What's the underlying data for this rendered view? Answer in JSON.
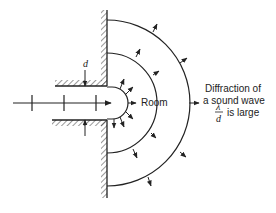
{
  "diagram": {
    "labels": {
      "d": "d",
      "room": "Room",
      "caption_line1": "Diffraction of",
      "caption_line2": "a sound wave",
      "fraction_numerator": "λ",
      "fraction_denominator": "d",
      "condition": "is large"
    },
    "elements": [
      {
        "name": "incident-wave-arrow",
        "description": "plane wave with three wavefront tick marks traveling right through the opening"
      },
      {
        "name": "wall",
        "description": "hatched vertical wall with hatched channel forming an opening of width d"
      },
      {
        "name": "wavefronts",
        "description": "three semicircular wavefronts spreading into the room with outward arrows"
      }
    ],
    "colors": {
      "stroke": "#222222",
      "background": "#ffffff"
    }
  }
}
